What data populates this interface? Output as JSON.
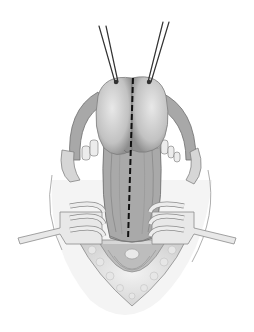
{
  "image": {
    "width": 254,
    "height": 332,
    "background": "#ffffff",
    "description": "Grayscale surgical illustration: retracted incision with two traction sutures at top, a bilobed structure with a dashed midline incision line, and two toothed retractors holding the wound edges open.",
    "colors": {
      "skin_outline": "#9a9a9a",
      "tissue_light": "#d8d8d8",
      "tissue_mid": "#b5b5b5",
      "tissue_dark": "#7a7a7a",
      "retractor": "#e6e6e6",
      "retractor_edge": "#8c8c8c",
      "suture": "#333333",
      "dashed_line": "#111111"
    }
  }
}
